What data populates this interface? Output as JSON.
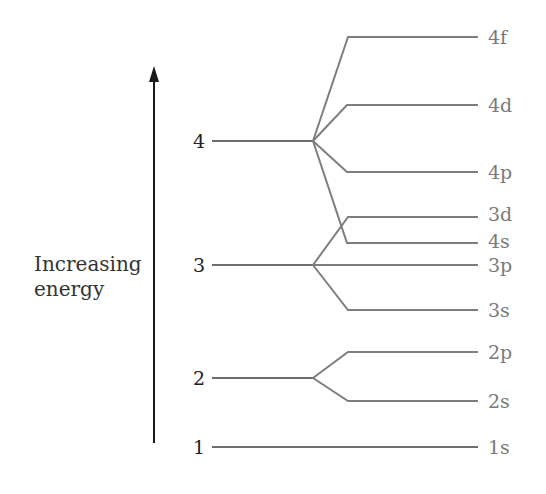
{
  "axis": {
    "label_line1": "Increasing",
    "label_line2": "energy",
    "arrow_color": "#1a1a1a"
  },
  "levels": [
    {
      "n": "1",
      "y": 447,
      "branch_x": 478
    },
    {
      "n": "2",
      "y": 378,
      "branch_x": 313
    },
    {
      "n": "3",
      "y": 265,
      "branch_x": 313
    },
    {
      "n": "4",
      "y": 141,
      "branch_x": 313
    }
  ],
  "orbitals": [
    {
      "label": "1s",
      "level": "1",
      "y": 447,
      "label_y": 447
    },
    {
      "label": "2s",
      "level": "2",
      "y": 401,
      "label_y": 401
    },
    {
      "label": "2p",
      "level": "2",
      "y": 352,
      "label_y": 352
    },
    {
      "label": "3s",
      "level": "3",
      "y": 310,
      "label_y": 310
    },
    {
      "label": "3p",
      "level": "3",
      "y": 265,
      "label_y": 266
    },
    {
      "label": "4s",
      "level": "4",
      "y": 243,
      "label_y": 243
    },
    {
      "label": "3d",
      "level": "3",
      "y": 217,
      "label_y": 215
    },
    {
      "label": "4p",
      "level": "4",
      "y": 172,
      "label_y": 173
    },
    {
      "label": "4d",
      "level": "4",
      "y": 105,
      "label_y": 106
    },
    {
      "label": "4f",
      "level": "4",
      "y": 37,
      "label_y": 40
    }
  ],
  "colors": {
    "level_line": "#6e6e6e",
    "orbital_line": "#7e7e7e",
    "orbital_text": "#7a7a7a",
    "level_text": "#222222"
  }
}
